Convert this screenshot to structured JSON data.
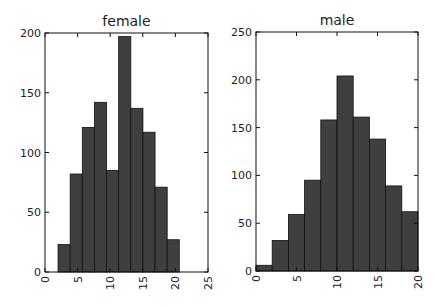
{
  "chart_data": [
    {
      "type": "bar",
      "subtype": "histogram",
      "title": "female",
      "xlabel": "",
      "ylabel": "",
      "bin_edges": [
        2.0,
        3.86,
        5.72,
        7.58,
        9.44,
        11.3,
        13.16,
        15.02,
        16.88,
        18.74,
        20.6
      ],
      "values": [
        23,
        82,
        121,
        142,
        85,
        197,
        137,
        117,
        71,
        27
      ],
      "xlim": [
        0,
        25
      ],
      "ylim": [
        0,
        200
      ],
      "xticks": [
        0,
        5,
        10,
        15,
        20,
        25
      ],
      "xtick_labels": [
        "0",
        "5",
        "10",
        "15",
        "20",
        "25"
      ],
      "yticks": [
        0,
        50,
        100,
        150,
        200
      ],
      "ytick_labels": [
        "0",
        "50",
        "100",
        "150",
        "200"
      ],
      "grid": false,
      "bar_color": "#3f3f3f"
    },
    {
      "type": "bar",
      "subtype": "histogram",
      "title": "male",
      "xlabel": "",
      "ylabel": "",
      "bin_edges": [
        0,
        2,
        4,
        6,
        8,
        10,
        12,
        14,
        16,
        18,
        20
      ],
      "values": [
        6,
        32,
        59,
        95,
        158,
        204,
        161,
        138,
        89,
        62
      ],
      "xlim": [
        0,
        20
      ],
      "ylim": [
        0,
        250
      ],
      "xticks": [
        0,
        5,
        10,
        15,
        20
      ],
      "xtick_labels": [
        "0",
        "5",
        "10",
        "15",
        "20"
      ],
      "yticks": [
        0,
        50,
        100,
        150,
        200,
        250
      ],
      "ytick_labels": [
        "0",
        "50",
        "100",
        "150",
        "200",
        "250"
      ],
      "grid": false,
      "bar_color": "#3f3f3f"
    }
  ]
}
